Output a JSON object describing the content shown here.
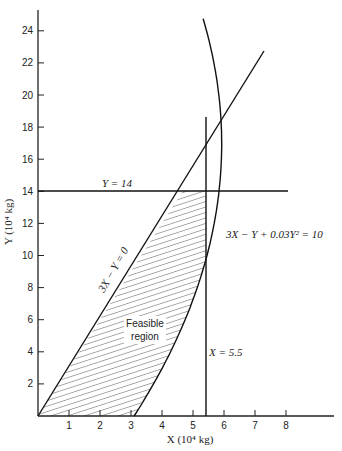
{
  "figure": {
    "x_axis": {
      "title": "X (10⁴ kg)",
      "ticks": [
        "1",
        "2",
        "3",
        "4",
        "5",
        "6",
        "7",
        "8"
      ]
    },
    "y_axis": {
      "title": "Y (10⁴ kg)",
      "ticks": [
        "2",
        "4",
        "6",
        "8",
        "10",
        "12",
        "14",
        "16",
        "18",
        "20",
        "22",
        "24"
      ]
    },
    "annotations": {
      "y14": "Y = 14",
      "line": "3X − Y = 0",
      "curve": "3X − Y + 0.03Y² = 10",
      "x55": "X = 5.5",
      "region_line1": "Feasible",
      "region_line2": "region"
    }
  },
  "chart_data": {
    "type": "line",
    "title": "",
    "xlabel": "X (10^4 kg)",
    "ylabel": "Y (10^4 kg)",
    "xlim": [
      0,
      9.6
    ],
    "ylim": [
      0,
      25
    ],
    "x_ticks": [
      1,
      2,
      3,
      4,
      5,
      6,
      7,
      8
    ],
    "y_ticks": [
      2,
      4,
      6,
      8,
      10,
      12,
      14,
      16,
      18,
      20,
      22,
      24
    ],
    "grid": false,
    "series": [
      {
        "name": "3X − Y = 0",
        "kind": "line",
        "points": [
          [
            0,
            0
          ],
          [
            7.2,
            21.6
          ]
        ]
      },
      {
        "name": "Y = 14",
        "kind": "hline",
        "y": 14,
        "x_range": [
          0,
          8
        ]
      },
      {
        "name": "X = 5.5",
        "kind": "vline",
        "x": 5.5,
        "y_range": [
          0,
          18.6
        ]
      },
      {
        "name": "3X − Y + 0.03Y² = 10",
        "kind": "curve",
        "points": [
          [
            3.33,
            0
          ],
          [
            3.97,
            2
          ],
          [
            4.56,
            4
          ],
          [
            5.09,
            6
          ],
          [
            5.57,
            8
          ],
          [
            6.0,
            10.5
          ],
          [
            6.04,
            14
          ],
          [
            5.93,
            18
          ],
          [
            5.77,
            21
          ],
          [
            5.57,
            24.5
          ]
        ]
      }
    ],
    "feasible_region": {
      "label": "Feasible region",
      "vertices": [
        [
          0,
          0
        ],
        [
          4.67,
          14
        ],
        [
          5.5,
          14
        ],
        [
          5.5,
          7.6
        ],
        [
          3.33,
          0
        ]
      ],
      "fill": "hatched"
    }
  }
}
